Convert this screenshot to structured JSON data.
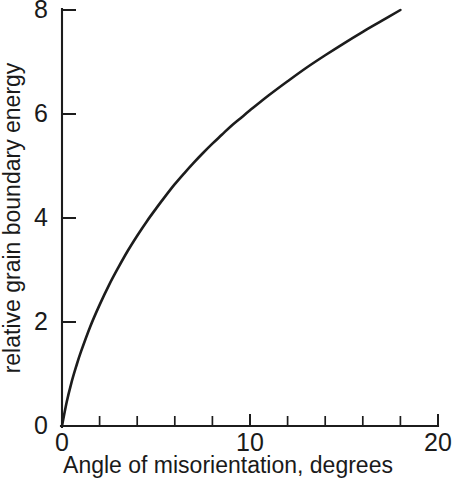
{
  "chart_data": {
    "type": "line",
    "title": "",
    "xlabel": "Angle of misorientation, degrees",
    "ylabel": "relative grain boundary energy",
    "xlim": [
      0,
      20
    ],
    "ylim": [
      0,
      8
    ],
    "grid": false,
    "legend": null,
    "x_major_ticks": [
      0,
      10,
      20
    ],
    "x_major_tick_labels": [
      "0",
      "10",
      "20"
    ],
    "x_minor_ticks": [
      2,
      4,
      6,
      8,
      12,
      14,
      16,
      18
    ],
    "y_major_ticks": [
      0,
      2,
      4,
      6,
      8
    ],
    "y_major_tick_labels": [
      "0",
      "2",
      "4",
      "6",
      "8"
    ],
    "y_minor_ticks": [],
    "line_color": "#1c1c1c",
    "background_color": "#ffffff",
    "series": [
      {
        "name": "Read-Shockley grain boundary energy",
        "x": [
          0,
          0.25,
          0.5,
          0.75,
          1,
          1.5,
          2,
          2.5,
          3,
          3.5,
          4,
          4.5,
          5,
          5.5,
          6,
          6.5,
          7,
          7.5,
          8,
          8.5,
          9,
          9.5,
          10,
          11,
          12,
          13,
          14,
          15,
          16,
          17,
          18
        ],
        "y": [
          0,
          0.46,
          0.83,
          1.14,
          1.42,
          1.91,
          2.33,
          2.71,
          3.05,
          3.37,
          3.66,
          3.93,
          4.18,
          4.42,
          4.65,
          4.86,
          5.06,
          5.25,
          5.43,
          5.6,
          5.77,
          5.92,
          6.07,
          6.36,
          6.63,
          6.89,
          7.13,
          7.36,
          7.58,
          7.79,
          8.0
        ]
      }
    ]
  },
  "axes": {
    "x_tick_labels": [
      {
        "value": "0"
      },
      {
        "value": "10"
      },
      {
        "value": "20"
      }
    ],
    "y_tick_labels": [
      {
        "value": "8"
      },
      {
        "value": "6"
      },
      {
        "value": "4"
      },
      {
        "value": "2"
      },
      {
        "value": "0"
      }
    ],
    "x_axis_title": "Angle of misorientation, degrees",
    "y_axis_title": "relative grain boundary energy"
  }
}
